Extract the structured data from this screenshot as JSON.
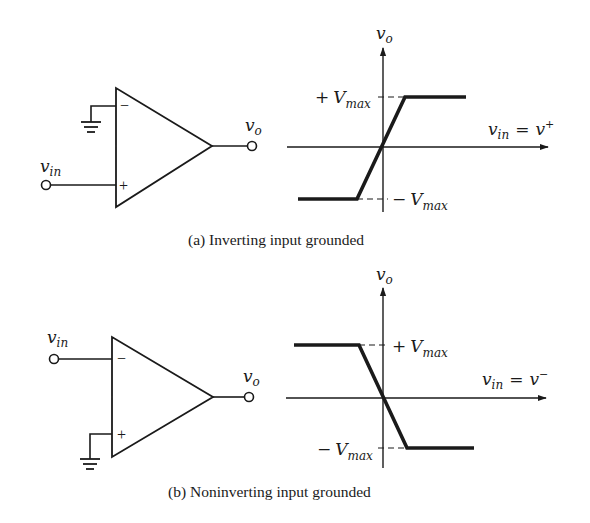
{
  "figure": {
    "panels": [
      {
        "id": "a",
        "caption": "(a) Inverting input grounded",
        "circuit": {
          "input_label_main": "v",
          "input_label_sub": "in",
          "output_label_main": "v",
          "output_label_sub": "o",
          "minus_sign": "−",
          "plus_sign": "+",
          "grounded_terminal": "inverting (−)",
          "signal_terminal": "noninverting (+)"
        },
        "graph": {
          "y_axis_main": "v",
          "y_axis_sub": "o",
          "x_axis_main": "v",
          "x_axis_sub": "in",
          "x_axis_eq": "=",
          "x_axis_rhs_main": "v",
          "x_axis_rhs_sup": "+",
          "pos_level_sign": "+",
          "pos_level_main": "V",
          "pos_level_sub": "max",
          "neg_level_sign": "−",
          "neg_level_main": "V",
          "neg_level_sub": "max"
        }
      },
      {
        "id": "b",
        "caption": "(b) Noninverting input grounded",
        "circuit": {
          "input_label_main": "v",
          "input_label_sub": "in",
          "output_label_main": "v",
          "output_label_sub": "o",
          "minus_sign": "−",
          "plus_sign": "+",
          "grounded_terminal": "noninverting (+)",
          "signal_terminal": "inverting (−)"
        },
        "graph": {
          "y_axis_main": "v",
          "y_axis_sub": "o",
          "x_axis_main": "v",
          "x_axis_sub": "in",
          "x_axis_eq": "=",
          "x_axis_rhs_main": "v",
          "x_axis_rhs_sup": "−",
          "pos_level_sign": "+",
          "pos_level_main": "V",
          "pos_level_sub": "max",
          "neg_level_sign": "−",
          "neg_level_main": "V",
          "neg_level_sub": "max"
        }
      }
    ]
  },
  "colors": {
    "ink": "#1a1a1a",
    "background": "#ffffff"
  }
}
